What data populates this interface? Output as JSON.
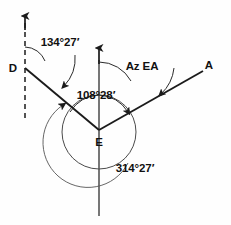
{
  "diagram": {
    "points": [
      {
        "id": "point-d",
        "label": "D",
        "x": 13,
        "y": 72
      },
      {
        "id": "point-a",
        "label": "A",
        "x": 209,
        "y": 69
      },
      {
        "id": "point-e",
        "label": "E",
        "x": 99,
        "y": 146
      }
    ],
    "angle_labels": [
      {
        "id": "azimuth-ed",
        "label": "134°27′",
        "x": 60,
        "y": 46
      },
      {
        "id": "azimuth-ea",
        "label": "Az EA",
        "x": 142,
        "y": 70
      },
      {
        "id": "interior-angle-dea",
        "label": "108°28′",
        "x": 96,
        "y": 99
      },
      {
        "id": "back-azimuth",
        "label": "314°27′",
        "x": 135,
        "y": 172
      }
    ],
    "colors": {
      "background": "#fefefe",
      "line": "#1b1b1b",
      "arc": "#2a2a2a",
      "circle": "#4a4a4a",
      "text": "#111111"
    }
  }
}
